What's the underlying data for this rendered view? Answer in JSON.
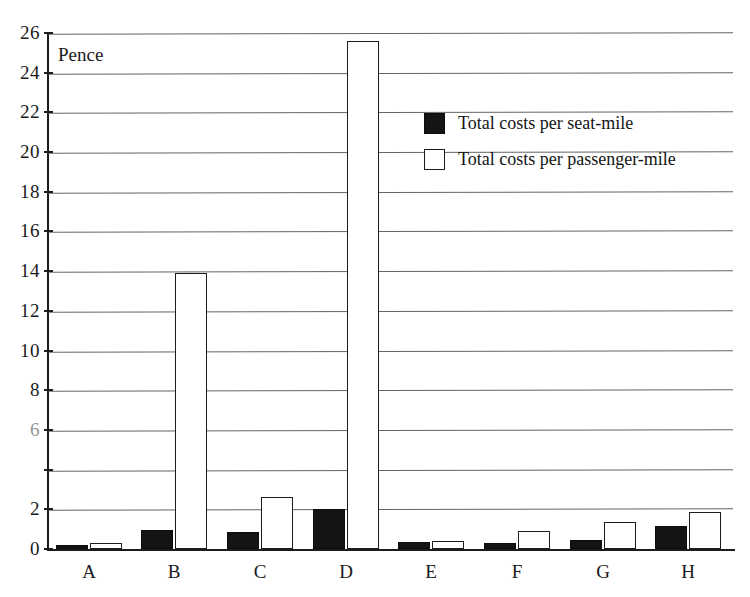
{
  "chart_data": {
    "type": "bar",
    "title": "",
    "subtitle": "",
    "xlabel": "",
    "ylabel": "Pence",
    "unit_note": "Pence",
    "categories": [
      "A",
      "B",
      "C",
      "D",
      "E",
      "F",
      "G",
      "H"
    ],
    "series": [
      {
        "name": "Total costs per seat-mile",
        "style": "filled-black",
        "values": [
          0.2,
          0.95,
          0.85,
          2.0,
          0.35,
          0.3,
          0.45,
          1.15
        ]
      },
      {
        "name": "Total costs per passenger-mile",
        "style": "outlined-white",
        "values": [
          0.3,
          13.9,
          2.6,
          25.6,
          0.4,
          0.9,
          1.35,
          1.85
        ]
      }
    ],
    "ylim": [
      0,
      26
    ],
    "ytick_step": 2,
    "ytick_labels": [
      "0",
      "2",
      "4",
      "6",
      "8",
      "10",
      "12",
      "14",
      "16",
      "18",
      "20",
      "22",
      "24",
      "26"
    ],
    "ytick_values": [
      0,
      2,
      4,
      6,
      8,
      10,
      12,
      14,
      16,
      18,
      20,
      22,
      24,
      26
    ],
    "ytick_faded": [
      6
    ],
    "ytick_missing": [
      4
    ],
    "grid": true,
    "grid_axis": "y",
    "legend_position": "upper-right",
    "legend_entries": [
      "Total costs per seat-mile",
      "Total costs per passenger-mile"
    ]
  },
  "axis": {
    "y_note": "Pence"
  },
  "legend": {
    "entry_seat_mile": "Total costs per seat-mile",
    "entry_passenger_mile": "Total costs per passenger-mile"
  }
}
